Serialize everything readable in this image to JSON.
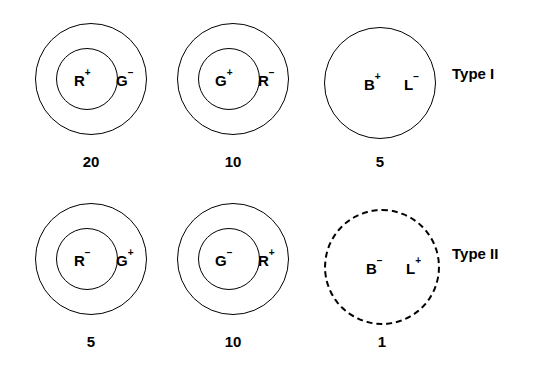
{
  "figure": {
    "rows": [
      {
        "type_label": "Type I",
        "type_label_x": 452,
        "type_label_y": 66,
        "cells": [
          {
            "name": "cell-r-plus-g-minus",
            "outer": {
              "cx": 91,
              "cy": 79,
              "r": 56
            },
            "inner": {
              "cx": 87,
              "cy": 79,
              "r": 31
            },
            "dashed": false,
            "inner_label_base": "R",
            "inner_label_sign": "+",
            "inner_label_x": 74,
            "inner_label_y": 73,
            "outer_label_base": "G",
            "outer_label_sign": "−",
            "outer_label_x": 116,
            "outer_label_y": 73,
            "count": "20",
            "count_x": 91,
            "count_y": 154
          },
          {
            "name": "cell-g-plus-r-minus",
            "outer": {
              "cx": 233,
              "cy": 79,
              "r": 56
            },
            "inner": {
              "cx": 229,
              "cy": 79,
              "r": 31
            },
            "dashed": false,
            "inner_label_base": "G",
            "inner_label_sign": "+",
            "inner_label_x": 215,
            "inner_label_y": 73,
            "outer_label_base": "R",
            "outer_label_sign": "−",
            "outer_label_x": 258,
            "outer_label_y": 73,
            "count": "10",
            "count_x": 233,
            "count_y": 154
          },
          {
            "name": "cell-b-plus-l-minus",
            "outer": {
              "cx": 380,
              "cy": 83,
              "r": 56
            },
            "inner": null,
            "dashed": false,
            "inner_label_base": "B",
            "inner_label_sign": "+",
            "inner_label_x": 364,
            "inner_label_y": 77,
            "outer_label_base": "L",
            "outer_label_sign": "−",
            "outer_label_x": 404,
            "outer_label_y": 77,
            "count": "5",
            "count_x": 380,
            "count_y": 154
          }
        ]
      },
      {
        "type_label": "Type II",
        "type_label_x": 452,
        "type_label_y": 246,
        "cells": [
          {
            "name": "cell-r-minus-g-plus",
            "outer": {
              "cx": 91,
              "cy": 259,
              "r": 56
            },
            "inner": {
              "cx": 87,
              "cy": 259,
              "r": 31
            },
            "dashed": false,
            "inner_label_base": "R",
            "inner_label_sign": "−",
            "inner_label_x": 74,
            "inner_label_y": 253,
            "outer_label_base": "G",
            "outer_label_sign": "+",
            "outer_label_x": 116,
            "outer_label_y": 253,
            "count": "5",
            "count_x": 91,
            "count_y": 334
          },
          {
            "name": "cell-g-minus-r-plus",
            "outer": {
              "cx": 233,
              "cy": 259,
              "r": 56
            },
            "inner": {
              "cx": 229,
              "cy": 259,
              "r": 31
            },
            "dashed": false,
            "inner_label_base": "G",
            "inner_label_sign": "−",
            "inner_label_x": 215,
            "inner_label_y": 253,
            "outer_label_base": "R",
            "outer_label_sign": "+",
            "outer_label_x": 258,
            "outer_label_y": 253,
            "count": "10",
            "count_x": 233,
            "count_y": 334
          },
          {
            "name": "cell-b-minus-l-plus",
            "outer": {
              "cx": 382,
              "cy": 267,
              "r": 58
            },
            "inner": null,
            "dashed": true,
            "inner_label_base": "B",
            "inner_label_sign": "−",
            "inner_label_x": 366,
            "inner_label_y": 261,
            "outer_label_base": "L",
            "outer_label_sign": "+",
            "outer_label_x": 406,
            "outer_label_y": 261,
            "count": "1",
            "count_x": 382,
            "count_y": 334
          }
        ]
      }
    ]
  },
  "colors": {
    "stroke": "#000000",
    "background": "#ffffff"
  }
}
